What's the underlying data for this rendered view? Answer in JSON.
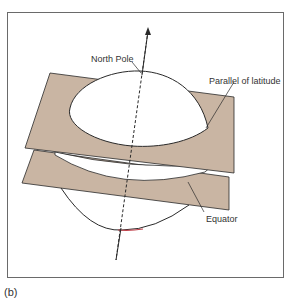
{
  "figure": {
    "caption": "(b)",
    "labels": {
      "north_pole": "North Pole",
      "parallel": "Parallel of latitude",
      "equator": "Equator"
    },
    "colors": {
      "plane_fill": "#c9b5a3",
      "outline": "#2a2a2a",
      "frame": "#6a6a6a"
    }
  }
}
